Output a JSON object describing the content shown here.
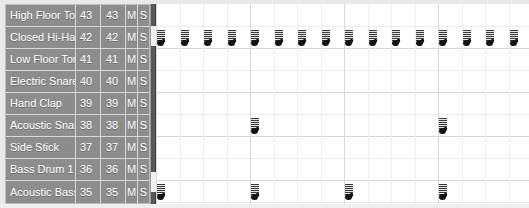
{
  "window": {
    "title": "Drum Track Editor",
    "width": 529,
    "height": 208
  },
  "colors": {
    "track_header_bg": "#8d8d8d",
    "track_header_text": "#ffffff",
    "separator": "#d8d8d8",
    "grid_bg": "#ffffff",
    "gridline_major": "#d5d5d5",
    "gridline_minor": "#efefef",
    "note_fill": "#141414",
    "divider": "#585858"
  },
  "track_list": {
    "columns": [
      "name",
      "note_number",
      "note_number_2",
      "mute",
      "solo"
    ],
    "mute_label": "M",
    "solo_label": "S",
    "rows": [
      {
        "name": "High Floor Tom",
        "num": "43",
        "num2": "43",
        "mute": "M",
        "solo": "S"
      },
      {
        "name": "Closed Hi-Hat",
        "num": "42",
        "num2": "42",
        "mute": "M",
        "solo": "S"
      },
      {
        "name": "Low Floor Tom",
        "num": "41",
        "num2": "41",
        "mute": "M",
        "solo": "S"
      },
      {
        "name": "Electric Snare",
        "num": "40",
        "num2": "40",
        "mute": "M",
        "solo": "S"
      },
      {
        "name": "Hand Clap",
        "num": "39",
        "num2": "39",
        "mute": "M",
        "solo": "S"
      },
      {
        "name": "Acoustic Snare",
        "num": "38",
        "num2": "38",
        "mute": "M",
        "solo": "S"
      },
      {
        "name": "Side Stick",
        "num": "37",
        "num2": "37",
        "mute": "M",
        "solo": "S"
      },
      {
        "name": "Bass Drum 1",
        "num": "36",
        "num2": "36",
        "mute": "M",
        "solo": "S"
      },
      {
        "name": "Acoustic Bass Drum",
        "num": "35",
        "num2": "35",
        "mute": "M",
        "solo": "S"
      }
    ]
  },
  "grid": {
    "row_height": 22,
    "bar_width": 94,
    "beat_width": 23.5,
    "columns": 16,
    "notes": [
      {
        "row": 1,
        "pitch": "42",
        "instrument": "Closed Hi-Hat",
        "step": 0
      },
      {
        "row": 1,
        "pitch": "42",
        "instrument": "Closed Hi-Hat",
        "step": 1
      },
      {
        "row": 1,
        "pitch": "42",
        "instrument": "Closed Hi-Hat",
        "step": 2
      },
      {
        "row": 1,
        "pitch": "42",
        "instrument": "Closed Hi-Hat",
        "step": 3
      },
      {
        "row": 1,
        "pitch": "42",
        "instrument": "Closed Hi-Hat",
        "step": 4
      },
      {
        "row": 1,
        "pitch": "42",
        "instrument": "Closed Hi-Hat",
        "step": 5
      },
      {
        "row": 1,
        "pitch": "42",
        "instrument": "Closed Hi-Hat",
        "step": 6
      },
      {
        "row": 1,
        "pitch": "42",
        "instrument": "Closed Hi-Hat",
        "step": 7
      },
      {
        "row": 1,
        "pitch": "42",
        "instrument": "Closed Hi-Hat",
        "step": 8
      },
      {
        "row": 1,
        "pitch": "42",
        "instrument": "Closed Hi-Hat",
        "step": 9
      },
      {
        "row": 1,
        "pitch": "42",
        "instrument": "Closed Hi-Hat",
        "step": 10
      },
      {
        "row": 1,
        "pitch": "42",
        "instrument": "Closed Hi-Hat",
        "step": 11
      },
      {
        "row": 1,
        "pitch": "42",
        "instrument": "Closed Hi-Hat",
        "step": 12
      },
      {
        "row": 1,
        "pitch": "42",
        "instrument": "Closed Hi-Hat",
        "step": 13
      },
      {
        "row": 1,
        "pitch": "42",
        "instrument": "Closed Hi-Hat",
        "step": 14
      },
      {
        "row": 1,
        "pitch": "42",
        "instrument": "Closed Hi-Hat",
        "step": 15
      },
      {
        "row": 5,
        "pitch": "38",
        "instrument": "Acoustic Snare",
        "step": 4
      },
      {
        "row": 5,
        "pitch": "38",
        "instrument": "Acoustic Snare",
        "step": 12
      },
      {
        "row": 8,
        "pitch": "35",
        "instrument": "Acoustic Bass Drum",
        "step": 0
      },
      {
        "row": 8,
        "pitch": "35",
        "instrument": "Acoustic Bass Drum",
        "step": 4
      },
      {
        "row": 8,
        "pitch": "35",
        "instrument": "Acoustic Bass Drum",
        "step": 8
      },
      {
        "row": 8,
        "pitch": "35",
        "instrument": "Acoustic Bass Drum",
        "step": 12
      }
    ]
  },
  "scrollbar": {
    "orientation": "vertical",
    "thumb_count": 2
  }
}
